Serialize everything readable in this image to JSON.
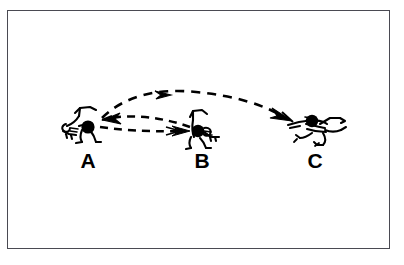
{
  "figure": {
    "type": "line-drawing-diagram",
    "border_color": "#4a4a52",
    "background_color": "#ffffff",
    "ink_color": "#000000",
    "canvas": {
      "width": 404,
      "height": 265
    }
  },
  "labels": [
    {
      "id": "A",
      "text": "A",
      "x": 88,
      "y": 168
    },
    {
      "id": "B",
      "text": "B",
      "x": 202,
      "y": 168
    },
    {
      "id": "C",
      "text": "C",
      "x": 315,
      "y": 168
    }
  ],
  "figures": [
    {
      "id": "player-a",
      "label": "A",
      "pose": "crouched-low-with-ball",
      "ball_x": 88,
      "ball_y": 127,
      "ball_radius": 6.5
    },
    {
      "id": "player-b",
      "label": "B",
      "pose": "crouched-low-with-ball",
      "ball_x": 198,
      "ball_y": 131,
      "ball_radius": 6.0
    },
    {
      "id": "player-c",
      "label": "C",
      "pose": "diving-horizontal",
      "ball_x": 312,
      "ball_y": 122,
      "ball_radius": 6.0
    }
  ],
  "trajectories": [
    {
      "id": "arc-a-to-c",
      "description": "High dashed arc from A over B to C",
      "from": "A",
      "to": "C",
      "arrowheads": [
        "mid-right",
        "end-right"
      ],
      "style": "dashed",
      "dash_pattern": "9 7"
    },
    {
      "id": "line-b-to-a",
      "description": "Shallow dashed arc returning from B to A",
      "from": "B",
      "to": "A",
      "arrowheads": [
        "end-left"
      ],
      "style": "dashed",
      "dash_pattern": "8 6"
    },
    {
      "id": "line-a-to-b",
      "description": "Straight dashed pass from A to B",
      "from": "A",
      "to": "B",
      "arrowheads": [
        "end-right"
      ],
      "style": "dashed",
      "dash_pattern": "8 6"
    }
  ]
}
